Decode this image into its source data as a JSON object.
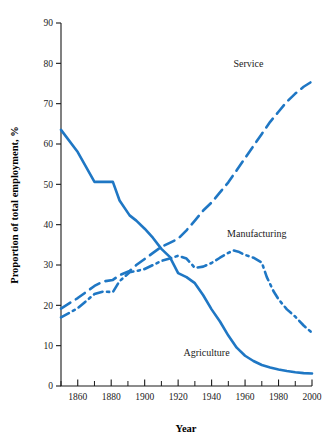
{
  "chart_data": {
    "type": "line",
    "title": "",
    "xlabel": "Year",
    "ylabel": "Proportion of total employment, %",
    "xlim": [
      1850,
      2000
    ],
    "ylim": [
      0,
      90
    ],
    "grid": false,
    "legend_position": "inline-annotations",
    "xticks": [
      1860,
      1880,
      1900,
      1920,
      1940,
      1960,
      1980,
      2000
    ],
    "xtick_labels": [
      "1860",
      "1880",
      "1900",
      "1920",
      "1940",
      "1960",
      "1980",
      "2000"
    ],
    "xticks_minor": [
      1850,
      1870,
      1890,
      1910,
      1930,
      1950,
      1970,
      1990
    ],
    "yticks": [
      0,
      10,
      20,
      30,
      40,
      50,
      60,
      70,
      80,
      90
    ],
    "ytick_labels": [
      "0",
      "10",
      "20",
      "30",
      "40",
      "50",
      "60",
      "70",
      "80",
      "90"
    ],
    "line_color": "#1F77C4",
    "series": [
      {
        "name": "Agriculture",
        "style": "solid",
        "label_x": 1937,
        "label_y": 7.5,
        "x": [
          1850,
          1860,
          1870,
          1875,
          1881,
          1885,
          1891,
          1895,
          1900,
          1905,
          1910,
          1915,
          1920,
          1925,
          1930,
          1935,
          1940,
          1945,
          1950,
          1955,
          1960,
          1965,
          1970,
          1975,
          1980,
          1985,
          1990,
          1995,
          2000
        ],
        "values": [
          63.5,
          58.0,
          50.6,
          50.6,
          50.6,
          46.0,
          42.3,
          41.0,
          39.0,
          36.7,
          34.0,
          32.0,
          28.0,
          27.0,
          25.5,
          22.5,
          19.0,
          16.0,
          12.5,
          9.5,
          7.5,
          6.2,
          5.2,
          4.6,
          4.1,
          3.7,
          3.4,
          3.2,
          3.1
        ]
      },
      {
        "name": "Manufacturing",
        "style": "dashdot",
        "label_x": 1967,
        "label_y": 37.0,
        "x": [
          1850,
          1860,
          1870,
          1875,
          1881,
          1885,
          1891,
          1895,
          1900,
          1905,
          1910,
          1915,
          1920,
          1925,
          1930,
          1935,
          1940,
          1945,
          1950,
          1953,
          1956,
          1960,
          1965,
          1970,
          1973,
          1977,
          1980,
          1985,
          1990,
          1995,
          2000
        ],
        "values": [
          17.0,
          19.3,
          22.8,
          23.4,
          23.3,
          26.0,
          28.2,
          28.5,
          29.0,
          30.0,
          31.0,
          31.6,
          32.3,
          31.6,
          29.3,
          29.6,
          30.5,
          31.8,
          33.0,
          33.6,
          33.3,
          32.5,
          31.8,
          30.6,
          27.0,
          23.5,
          21.5,
          19.0,
          17.2,
          15.0,
          13.2
        ]
      },
      {
        "name": "Service",
        "style": "dashed",
        "label_x": 1962,
        "label_y": 79.0,
        "x": [
          1850,
          1860,
          1870,
          1875,
          1881,
          1885,
          1891,
          1895,
          1900,
          1905,
          1910,
          1915,
          1920,
          1925,
          1930,
          1935,
          1940,
          1945,
          1950,
          1955,
          1960,
          1965,
          1970,
          1975,
          1980,
          1985,
          1990,
          1995,
          2000
        ],
        "values": [
          19.2,
          21.8,
          24.8,
          25.9,
          26.3,
          27.5,
          28.5,
          30.0,
          31.5,
          33.0,
          34.5,
          35.5,
          36.5,
          38.6,
          41.0,
          43.5,
          45.5,
          48.0,
          50.5,
          53.5,
          56.5,
          59.5,
          62.5,
          65.5,
          68.0,
          70.5,
          72.5,
          74.2,
          75.5
        ]
      }
    ]
  }
}
